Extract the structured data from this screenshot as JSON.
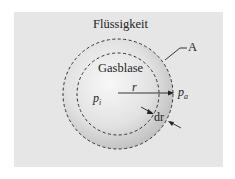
{
  "diagram": {
    "labels": {
      "medium": "Flüssigkeit",
      "bubble": "Gasblase",
      "surface": "A",
      "radius": "r",
      "inner_pressure": "p",
      "inner_pressure_sub": "i",
      "outer_pressure": "p",
      "outer_pressure_sub": "a",
      "thickness": "dr"
    },
    "colors": {
      "panel": "#e6e6e6",
      "sphere_light": "#f7f7f7",
      "sphere_dark": "#bfbfbf",
      "line": "#333333"
    }
  }
}
